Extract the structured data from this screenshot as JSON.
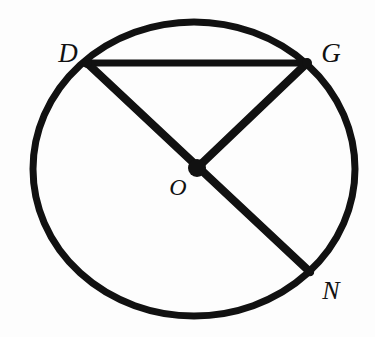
{
  "figure": {
    "background_color": "#fdfdfd",
    "stroke_color": "#111111",
    "canvas": {
      "width": 375,
      "height": 337
    }
  },
  "circle": {
    "name": "circle-O",
    "center": {
      "x": 194,
      "y": 169
    },
    "rx": 161,
    "ry": 147,
    "stroke_width": 7
  },
  "points": [
    {
      "id": "D",
      "label": "D",
      "x": 87,
      "y": 63,
      "label_x": 68,
      "label_y": 53,
      "on_circle": true
    },
    {
      "id": "G",
      "label": "G",
      "x": 307,
      "y": 63,
      "label_x": 331,
      "label_y": 53,
      "on_circle": true
    },
    {
      "id": "O",
      "label": "O",
      "x": 197,
      "y": 168,
      "label_x": 178,
      "label_y": 187,
      "on_circle": false
    },
    {
      "id": "N",
      "label": "N",
      "x": 310,
      "y": 272,
      "label_x": 331,
      "label_y": 291,
      "on_circle": true
    }
  ],
  "segments": [
    {
      "id": "DG",
      "name": "chord-DG",
      "from": "D",
      "to": "G",
      "x1": 87,
      "y1": 63,
      "x2": 307,
      "y2": 63,
      "stroke_width": 7
    },
    {
      "id": "DN",
      "name": "diameter-DN",
      "from": "D",
      "to": "N",
      "x1": 87,
      "y1": 63,
      "x2": 310,
      "y2": 272,
      "stroke_width": 8
    },
    {
      "id": "OG",
      "name": "radius-OG",
      "from": "O",
      "to": "G",
      "x1": 197,
      "y1": 168,
      "x2": 307,
      "y2": 63,
      "stroke_width": 8
    }
  ],
  "center_dot": {
    "name": "center-point-O",
    "x": 197,
    "y": 168,
    "radius": 9
  }
}
